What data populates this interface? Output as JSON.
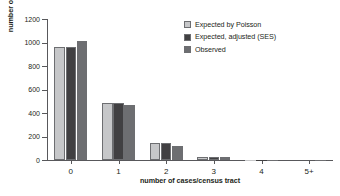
{
  "chart_data": {
    "type": "bar",
    "title": "",
    "xlabel": "number of cases/census tract",
    "ylabel": "number of census tracts",
    "categories": [
      "0",
      "1",
      "2",
      "3",
      "4",
      "5+"
    ],
    "series": [
      {
        "name": "Expected by Poisson",
        "color": "#c6c7c9",
        "values": [
          965,
          483,
          142,
          27,
          4,
          0
        ]
      },
      {
        "name": "Expected, adjusted (SES)",
        "color": "#414042",
        "values": [
          965,
          483,
          141,
          25,
          3,
          0
        ]
      },
      {
        "name": "Observed",
        "color": "#6d6e71",
        "values": [
          1010,
          470,
          118,
          22,
          4,
          1
        ]
      }
    ],
    "ylim": [
      0,
      1200
    ],
    "yticks": [
      0,
      200,
      400,
      600,
      800,
      1000,
      1200
    ],
    "ytick_labels": [
      "0",
      "200",
      "400",
      "600",
      "800",
      "1000",
      "1200"
    ],
    "grid": false,
    "legend_position": "top-right"
  },
  "legend": {
    "entries": [
      {
        "label": "Expected by Poisson"
      },
      {
        "label": "Expected, adjusted (SES)"
      },
      {
        "label": "Observed"
      }
    ]
  }
}
